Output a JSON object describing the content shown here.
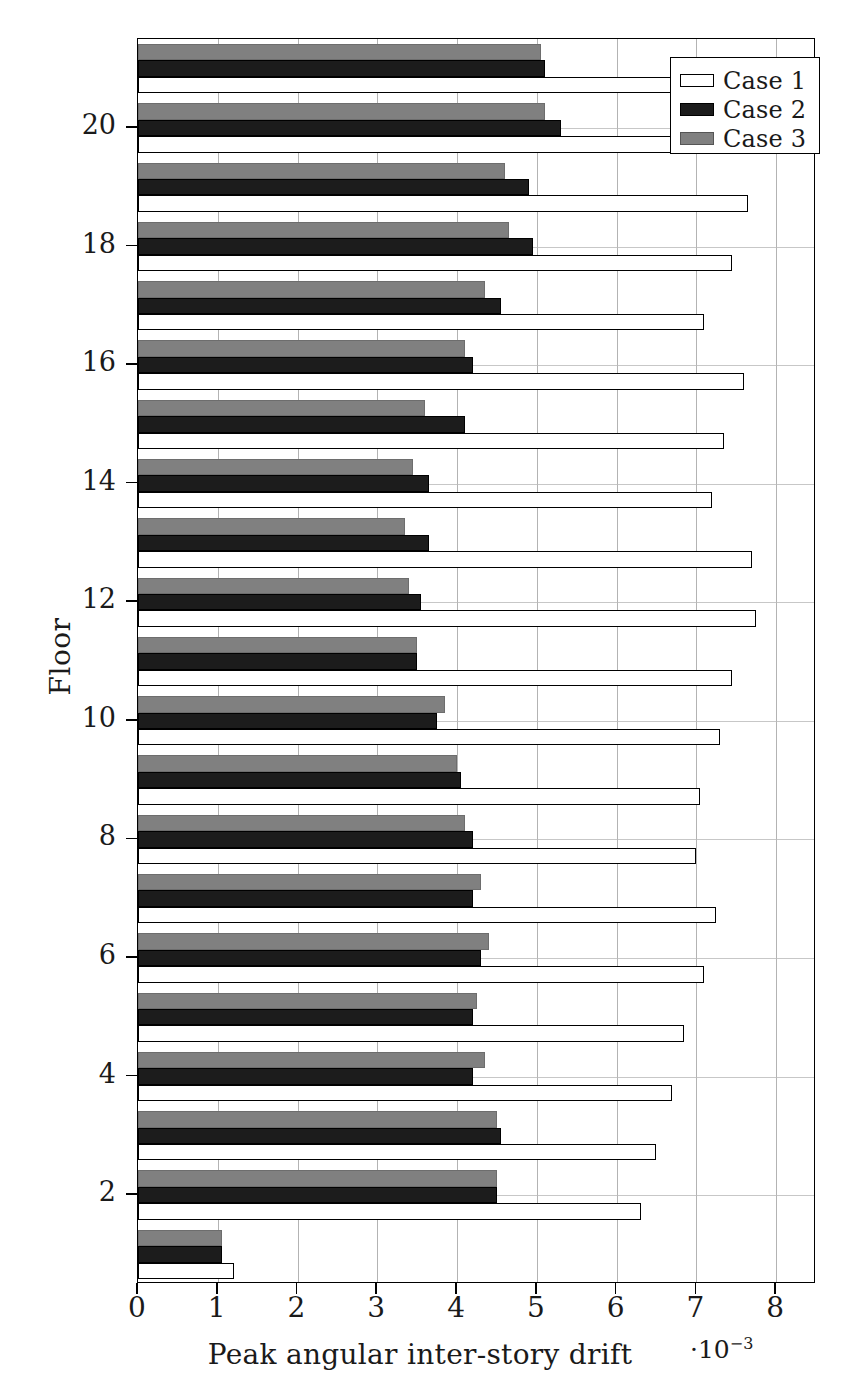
{
  "chart_data": {
    "type": "bar",
    "orientation": "horizontal",
    "title": "",
    "xlabel": "Peak angular inter-story drift",
    "ylabel": "Floor",
    "x_multiplier": "·10",
    "x_multiplier_exponent": "−3",
    "xlim": [
      0,
      8.5
    ],
    "ylim": [
      0.5,
      21.5
    ],
    "xticks": [
      "0",
      "1",
      "2",
      "3",
      "4",
      "5",
      "6",
      "7",
      "8"
    ],
    "xtick_values": [
      0,
      1,
      2,
      3,
      4,
      5,
      6,
      7,
      8
    ],
    "yticks": [
      "2",
      "4",
      "6",
      "8",
      "10",
      "12",
      "14",
      "16",
      "18",
      "20"
    ],
    "ytick_values": [
      2,
      4,
      6,
      8,
      10,
      12,
      14,
      16,
      18,
      20
    ],
    "grid": true,
    "legend_position": "upper right",
    "categories": [
      1,
      2,
      3,
      4,
      5,
      6,
      7,
      8,
      9,
      10,
      11,
      12,
      13,
      14,
      15,
      16,
      17,
      18,
      19,
      20,
      21
    ],
    "series": [
      {
        "name": "Case 1",
        "color": "#ffffff",
        "edge": "#000000",
        "values": [
          1.2,
          6.3,
          6.5,
          6.7,
          6.85,
          7.1,
          7.25,
          7.0,
          7.05,
          7.3,
          7.45,
          7.75,
          7.7,
          7.2,
          7.35,
          7.6,
          7.1,
          7.45,
          7.65,
          7.0,
          6.9
        ]
      },
      {
        "name": "Case 2",
        "color": "#1c1c1c",
        "edge": "#000000",
        "values": [
          1.05,
          4.5,
          4.55,
          4.2,
          4.2,
          4.3,
          4.2,
          4.2,
          4.05,
          3.75,
          3.5,
          3.55,
          3.65,
          3.65,
          4.1,
          4.2,
          4.55,
          4.95,
          4.9,
          5.3,
          5.1
        ]
      },
      {
        "name": "Case 3",
        "color": "#808080",
        "edge": "#6d6d6d",
        "values": [
          1.05,
          4.5,
          4.5,
          4.35,
          4.25,
          4.4,
          4.3,
          4.1,
          4.0,
          3.85,
          3.5,
          3.4,
          3.35,
          3.45,
          3.6,
          4.1,
          4.35,
          4.65,
          4.6,
          5.1,
          5.05
        ]
      }
    ]
  },
  "legend": {
    "items": [
      {
        "label": "Case 1",
        "swatch": "case-1-swatch"
      },
      {
        "label": "Case 2",
        "swatch": "case-2-swatch"
      },
      {
        "label": "Case 3",
        "swatch": "case-3-swatch"
      }
    ]
  },
  "axes": {
    "x_label": "Peak angular inter-story drift",
    "y_label": "Floor",
    "x_multiplier_prefix": "·10",
    "x_multiplier_sup": "−3"
  }
}
